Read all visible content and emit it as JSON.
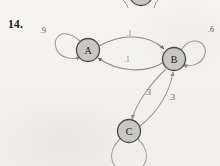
{
  "figure": {
    "exercise_number": "14.",
    "type": "state-transition-diagram"
  },
  "nodes": [
    {
      "id": "A",
      "label": "A",
      "cx": 88,
      "cy": 50,
      "r": 11.5
    },
    {
      "id": "B",
      "label": "B",
      "cx": 174,
      "cy": 59,
      "r": 11.5
    },
    {
      "id": "C",
      "label": "C",
      "cx": 129,
      "cy": 131,
      "r": 11.5
    },
    {
      "id": "partial_top",
      "label": "",
      "cx": 141,
      "cy": -6,
      "r": 11.5
    }
  ],
  "labels": {
    "self_loop_a": ".9",
    "self_loop_b": ".6",
    "a_to_b": ".1",
    "b_to_a": ".1",
    "b_to_c": ".3",
    "c_to_b": ".3"
  },
  "edges": [
    {
      "from": "A",
      "to": "A",
      "label": ".9",
      "kind": "self-loop"
    },
    {
      "from": "A",
      "to": "B",
      "label": ".1",
      "kind": "curved"
    },
    {
      "from": "B",
      "to": "A",
      "label": ".1",
      "kind": "curved"
    },
    {
      "from": "B",
      "to": "B",
      "label": ".6",
      "kind": "self-loop"
    },
    {
      "from": "B",
      "to": "C",
      "label": ".3",
      "kind": "curved"
    },
    {
      "from": "C",
      "to": "B",
      "label": ".3",
      "kind": "curved"
    },
    {
      "from": "C",
      "to": "C",
      "label": "",
      "kind": "self-loop"
    }
  ],
  "colors": {
    "page_background": "#f4f2ef",
    "node_fill": "#c9c7c4",
    "node_stroke": "#4a4744",
    "edge_stroke": "#9b9692",
    "text": "#1e1c1a",
    "label_text": "#56524e"
  }
}
